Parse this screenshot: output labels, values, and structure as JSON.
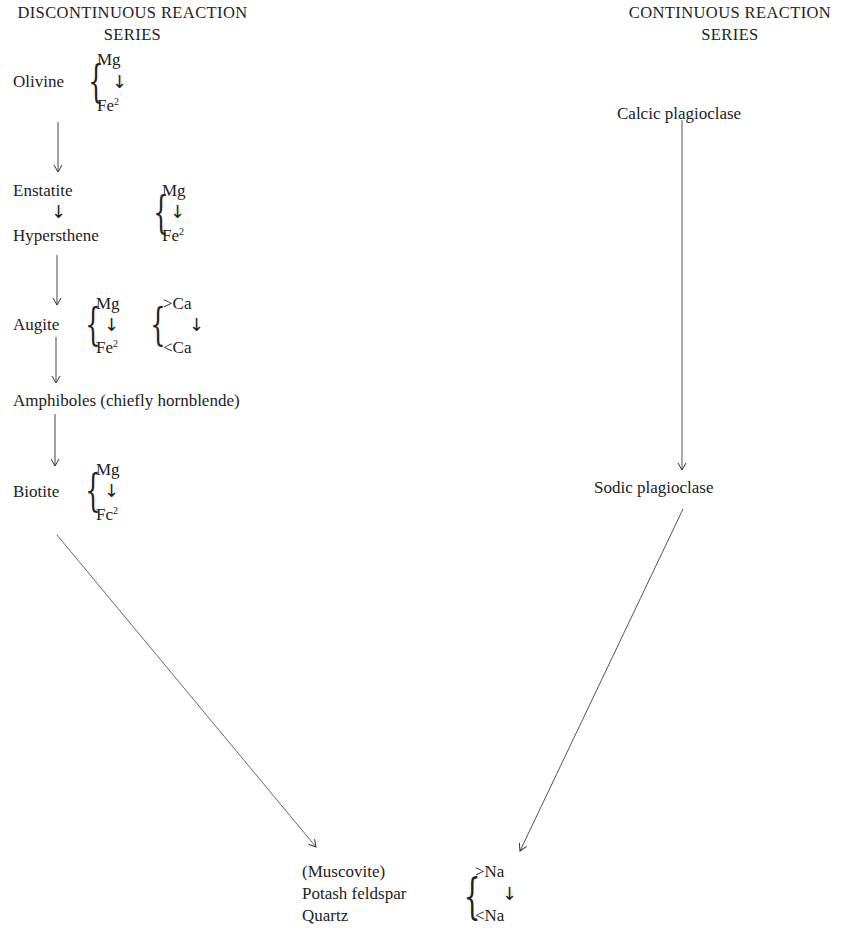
{
  "headers": {
    "discontinuous": {
      "line1": "DISCONTINUOUS REACTION",
      "line2": "SERIES"
    },
    "continuous": {
      "line1": "CONTINUOUS REACTION",
      "line2": "SERIES"
    }
  },
  "discontinuous_series": {
    "olivine": {
      "name": "Olivine",
      "top": "Mg",
      "arrow": "↓",
      "bottom": "Fe",
      "bottom_sup": "2"
    },
    "enstatite": {
      "name": "Enstatite"
    },
    "hypersthene": {
      "name": "Hypersthene"
    },
    "enstatite_hypersthene_brace": {
      "top": "Mg",
      "arrow": "↓",
      "bottom": "Fe",
      "bottom_sup": "2"
    },
    "augite": {
      "name": "Augite",
      "top": "Mg",
      "arrow": "↓",
      "bottom": "Fe",
      "bottom_sup": "2",
      "ca_top": ">Ca",
      "ca_arrow": "↓",
      "ca_bottom": "<Ca"
    },
    "amphiboles": {
      "name": "Amphiboles (chiefly hornblende)"
    },
    "biotite": {
      "name": "Biotite",
      "top": "Mg",
      "arrow": "↓",
      "bottom": "Fc",
      "bottom_sup": "2"
    }
  },
  "continuous_series": {
    "calcic": {
      "name": "Calcic plagioclase"
    },
    "sodic": {
      "name": "Sodic plagioclase"
    }
  },
  "final_stage": {
    "muscovite": "(Muscovite)",
    "potash_feldspar": "Potash feldspar",
    "quartz": "Quartz",
    "na_top": ">Na",
    "na_arrow": "↓",
    "na_bottom": "<Na"
  },
  "colors": {
    "ink": "#222222",
    "line": "#555555",
    "background": "#ffffff"
  }
}
